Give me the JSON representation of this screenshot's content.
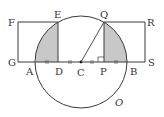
{
  "diagram": {
    "colors": {
      "stroke": "#3a3a3a",
      "shade": "#c8c8c8",
      "background": "#ffffff"
    },
    "labels": {
      "F": "F",
      "E": "E",
      "Q": "Q",
      "R": "R",
      "G": "G",
      "A": "A",
      "D": "D",
      "C": "C",
      "P": "P",
      "B": "B",
      "S": "S",
      "O": "O"
    },
    "marks": {
      "equal_segments": [
        "AD",
        "DC",
        "CP",
        "PB"
      ],
      "right_angle_at": "P"
    }
  }
}
